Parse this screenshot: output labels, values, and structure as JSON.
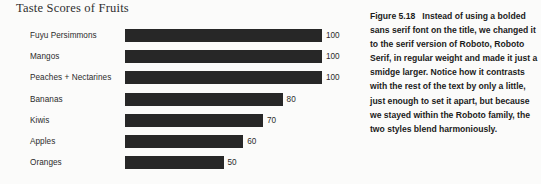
{
  "chart": {
    "title": "Taste Scores of Fruits",
    "value_suffix": ""
  },
  "chart_data": {
    "type": "bar",
    "orientation": "horizontal",
    "title": "Taste Scores of Fruits",
    "xlabel": "",
    "ylabel": "",
    "xlim": [
      0,
      100
    ],
    "grid": false,
    "legend": false,
    "bar_color": "#272727",
    "categories": [
      "Fuyu Persimmons",
      "Mangos",
      "Peaches + Nectarines",
      "Bananas",
      "Kiwis",
      "Apples",
      "Oranges"
    ],
    "values": [
      100,
      100,
      100,
      80,
      70,
      60,
      50
    ],
    "value_labels": [
      "100",
      "100",
      "100",
      "80",
      "70",
      "60",
      "50"
    ]
  },
  "caption": {
    "figure_number": "Figure 5.18",
    "lines": [
      "Instead of using a",
      "bolded sans serif font on the",
      "title, we changed it to the serif",
      "version of Roboto, Roboto Serif,",
      "in regular weight and made it",
      "just a smidge larger. Notice how",
      "it contrasts with the rest of the",
      "text by only a little, just enough",
      "to set it apart, but because we",
      "stayed within the Roboto family,",
      "the two styles blend",
      "harmoniously."
    ]
  }
}
